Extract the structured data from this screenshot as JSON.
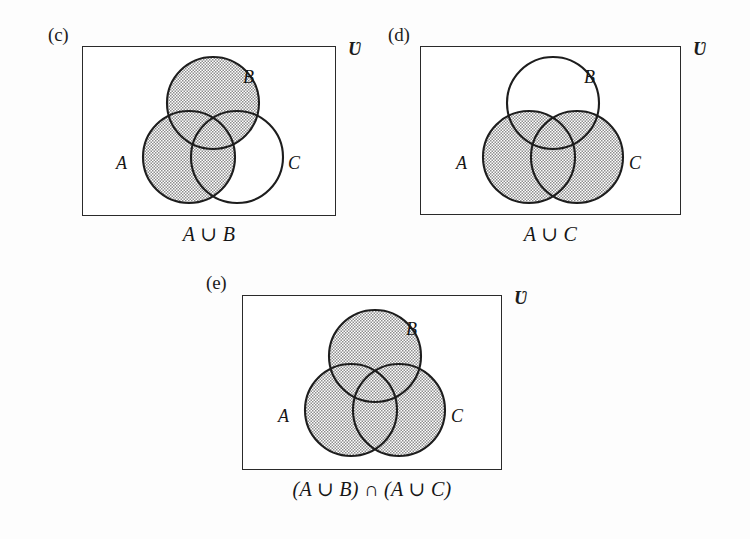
{
  "figure": {
    "background_color": "#fdfdfd",
    "ink_color": "#2a2a2a",
    "shade_color": "#c9c9c9",
    "universe_symbol": "Ʋ"
  },
  "panels": [
    {
      "tag": "(c)",
      "universe": "Ʋ",
      "caption": "A ∪ B",
      "set_labels": {
        "a": "A",
        "b": "B",
        "c": "C"
      },
      "shaded_sets": [
        "A",
        "B"
      ],
      "box": {
        "x": 82,
        "y": 46,
        "w": 254,
        "h": 170
      },
      "circles": {
        "a": {
          "cx": 106,
          "cy": 110,
          "r": 46
        },
        "b": {
          "cx": 130,
          "cy": 56,
          "r": 46
        },
        "c": {
          "cx": 154,
          "cy": 110,
          "r": 46
        }
      },
      "label_positions": {
        "a": {
          "x": 33,
          "y": 106
        },
        "b": {
          "x": 160,
          "y": 20
        },
        "c": {
          "x": 205,
          "y": 106
        }
      },
      "tag_position": {
        "x": 48,
        "y": 24
      },
      "universe_position": {
        "x": 348,
        "y": 38
      },
      "caption_position": {
        "x": 82,
        "y": 222,
        "w": 254
      }
    },
    {
      "tag": "(d)",
      "universe": "Ʋ",
      "caption": "A ∪ C",
      "set_labels": {
        "a": "A",
        "b": "B",
        "c": "C"
      },
      "shaded_sets": [
        "A",
        "C"
      ],
      "box": {
        "x": 420,
        "y": 46,
        "w": 261,
        "h": 169
      },
      "circles": {
        "a": {
          "cx": 108,
          "cy": 110,
          "r": 46
        },
        "b": {
          "cx": 132,
          "cy": 56,
          "r": 46
        },
        "c": {
          "cx": 156,
          "cy": 110,
          "r": 46
        }
      },
      "label_positions": {
        "a": {
          "x": 35,
          "y": 106
        },
        "b": {
          "x": 163,
          "y": 20
        },
        "c": {
          "x": 208,
          "y": 106
        }
      },
      "tag_position": {
        "x": 388,
        "y": 24
      },
      "universe_position": {
        "x": 693,
        "y": 38
      },
      "caption_position": {
        "x": 420,
        "y": 222,
        "w": 261
      }
    },
    {
      "tag": "(e)",
      "universe": "Ʋ",
      "caption": "(A ∪ B) ∩ (A ∪ C)",
      "set_labels": {
        "a": "A",
        "b": "B",
        "c": "C"
      },
      "shaded_sets": [
        "A",
        "B",
        "C"
      ],
      "box": {
        "x": 242,
        "y": 295,
        "w": 260,
        "h": 175
      },
      "circles": {
        "a": {
          "cx": 108,
          "cy": 114,
          "r": 46
        },
        "b": {
          "cx": 132,
          "cy": 60,
          "r": 46
        },
        "c": {
          "cx": 156,
          "cy": 114,
          "r": 46
        }
      },
      "label_positions": {
        "a": {
          "x": 35,
          "y": 110
        },
        "b": {
          "x": 163,
          "y": 23
        },
        "c": {
          "x": 208,
          "y": 110
        }
      },
      "tag_position": {
        "x": 206,
        "y": 272,
        "w": 0
      },
      "universe_position": {
        "x": 514,
        "y": 287
      },
      "caption_position": {
        "x": 242,
        "y": 477,
        "w": 260
      }
    }
  ],
  "chart_data": {
    "type": "diagram",
    "diagram_kind": "venn-3-set",
    "title": "",
    "panels": [
      {
        "label": "(c)",
        "expression": "A ∪ B",
        "sets": [
          "A",
          "B",
          "C"
        ],
        "shaded_regions": [
          "A",
          "B",
          "A∩B",
          "A∩C",
          "B∩C",
          "A∩B∩C"
        ],
        "unshaded_regions": [
          "C only",
          "universe outside circles"
        ],
        "universe_symbol": "Ʋ"
      },
      {
        "label": "(d)",
        "expression": "A ∪ C",
        "sets": [
          "A",
          "B",
          "C"
        ],
        "shaded_regions": [
          "A",
          "C",
          "A∩B",
          "A∩C",
          "B∩C",
          "A∩B∩C"
        ],
        "unshaded_regions": [
          "B only",
          "universe outside circles"
        ],
        "universe_symbol": "Ʋ"
      },
      {
        "label": "(e)",
        "expression": "(A ∪ B) ∩ (A ∪ C)",
        "sets": [
          "A",
          "B",
          "C"
        ],
        "shaded_regions": [
          "A",
          "B",
          "C",
          "A∩B",
          "A∩C",
          "B∩C",
          "A∩B∩C"
        ],
        "unshaded_regions": [
          "universe outside circles"
        ],
        "universe_symbol": "Ʋ"
      }
    ]
  }
}
